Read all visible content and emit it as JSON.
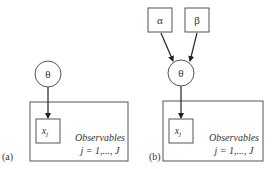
{
  "panels": [
    {
      "label": "(a)",
      "theta_node": "θ",
      "observed_node": {
        "base": "x",
        "sub": "j"
      },
      "plate": {
        "title": "Observables",
        "range": "j = 1,..., J"
      }
    },
    {
      "label": "(b)",
      "hyper_nodes": [
        "α",
        "β"
      ],
      "theta_node": "θ",
      "observed_node": {
        "base": "x",
        "sub": "j"
      },
      "plate": {
        "title": "Observables",
        "range": "j = 1,..., J"
      }
    }
  ],
  "colors": {
    "line": "#555555",
    "arrow": "#222222",
    "text": "#333333",
    "background": "#ffffff"
  }
}
